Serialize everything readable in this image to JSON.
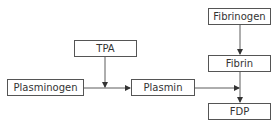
{
  "diagram": {
    "nodes": [
      {
        "id": "fibrinogen",
        "label": "Fibrinogen"
      },
      {
        "id": "tpa",
        "label": "TPA"
      },
      {
        "id": "fibrin",
        "label": "Fibrin"
      },
      {
        "id": "plasminogen",
        "label": "Plasminogen"
      },
      {
        "id": "plasmin",
        "label": "Plasmin"
      },
      {
        "id": "fdp",
        "label": "FDP"
      }
    ],
    "edges": [
      {
        "from": "plasminogen",
        "to": "plasmin"
      },
      {
        "from": "tpa",
        "to": "plasminogen-plasmin-edge"
      },
      {
        "from": "fibrinogen",
        "to": "fibrin"
      },
      {
        "from": "fibrin",
        "to": "fdp"
      },
      {
        "from": "plasmin",
        "to": "fibrin-fdp-edge"
      }
    ],
    "colors": {
      "line": "#333333",
      "border": "#555555",
      "text": "#333333"
    }
  }
}
